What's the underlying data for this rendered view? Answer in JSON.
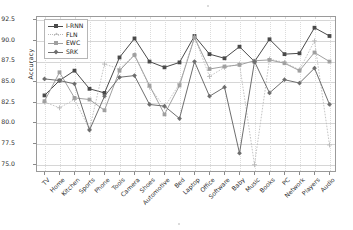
{
  "chart_data": {
    "type": "line",
    "title": "",
    "xlabel": "",
    "ylabel": "Accuracy",
    "ylim": [
      74.0,
      92.9
    ],
    "yticks": [
      75.0,
      77.5,
      80.0,
      82.5,
      85.0,
      87.5,
      90.0,
      92.5
    ],
    "ytick_labels": [
      "75.0",
      "77.5",
      "80.0",
      "82.5",
      "85.0",
      "87.5",
      "90.0",
      "92.5"
    ],
    "grid": true,
    "legend_position": "upper left",
    "categories": [
      "TV",
      "Home",
      "Kitchen",
      "Sports",
      "Phone",
      "Tools",
      "Camera",
      "Shoes",
      "Automotive",
      "Bed",
      "Laptop",
      "Office",
      "Software",
      "Baby",
      "Music",
      "Books",
      "PC",
      "Network",
      "Players",
      "Audio"
    ],
    "series": [
      {
        "name": "I-RNN",
        "color": "#4a4a4a",
        "marker": "square",
        "linestyle": "solid",
        "values": [
          83.4,
          85.2,
          86.4,
          84.2,
          83.7,
          88.0,
          90.3,
          87.5,
          86.8,
          87.4,
          90.6,
          88.4,
          87.9,
          89.3,
          87.5,
          90.2,
          88.4,
          88.5,
          91.6,
          90.6
        ]
      },
      {
        "name": "FLN",
        "color": "#b9b9b9",
        "marker": "plus",
        "linestyle": "dotted",
        "values": [
          82.6,
          81.9,
          82.9,
          79.3,
          87.2,
          86.6,
          88.3,
          84.4,
          82.0,
          84.8,
          90.5,
          85.7,
          86.8,
          87.2,
          75.0,
          87.8,
          87.4,
          86.5,
          90.0,
          77.4
        ]
      },
      {
        "name": "EWC",
        "color": "#a0a0a0",
        "marker": "square",
        "linestyle": "solid",
        "values": [
          82.7,
          86.2,
          83.1,
          82.9,
          81.6,
          86.4,
          88.3,
          84.6,
          81.1,
          84.6,
          90.4,
          86.6,
          86.9,
          87.1,
          87.6,
          87.7,
          87.3,
          86.4,
          88.6,
          87.5
        ]
      },
      {
        "name": "SRK",
        "color": "#6e6e6e",
        "marker": "diamond",
        "linestyle": "solid",
        "values": [
          85.4,
          85.2,
          84.8,
          79.2,
          83.3,
          85.6,
          85.8,
          82.3,
          82.1,
          80.6,
          87.5,
          83.3,
          84.4,
          76.4,
          87.5,
          83.7,
          85.3,
          84.9,
          86.7,
          82.3
        ]
      }
    ]
  }
}
